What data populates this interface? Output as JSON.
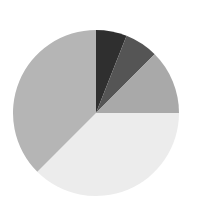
{
  "chart_data": {
    "type": "pie",
    "title": "",
    "categories": [
      "Slice 1",
      "Slice 2",
      "Slice 3",
      "Slice 4",
      "Slice 5"
    ],
    "values": [
      6,
      6.5,
      12.5,
      37.5,
      37.5
    ],
    "colors": [
      "#2f2f2f",
      "#555555",
      "#a9a9a9",
      "#ececec",
      "#b5b5b5"
    ],
    "start_angle_deg": 0,
    "direction": "clockwise",
    "legend": "none",
    "center": [
      96,
      113
    ],
    "radius": 83
  }
}
